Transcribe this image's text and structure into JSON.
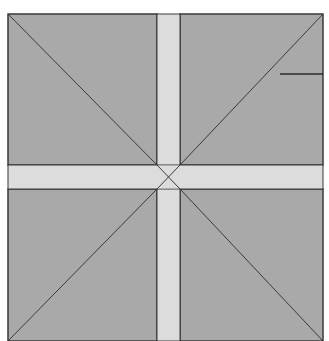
{
  "diagram": {
    "type": "quilt-block-geometry",
    "colors": {
      "background": "#ffffff",
      "quadrant_fill": "#a9a9a9",
      "sashing_fill": "#dcdcdc",
      "stroke": "#3a3a3a"
    },
    "outer_square": {
      "x": 8,
      "y": 14,
      "width": 315,
      "height": 327
    },
    "vertical_band": {
      "x": 157,
      "width": 23
    },
    "horizontal_band": {
      "y": 165,
      "height": 24
    },
    "center_point": {
      "x": 168,
      "y": 177
    },
    "marker_line": {
      "x1": 280,
      "y1": 74,
      "x2": 323,
      "y2": 74
    }
  }
}
